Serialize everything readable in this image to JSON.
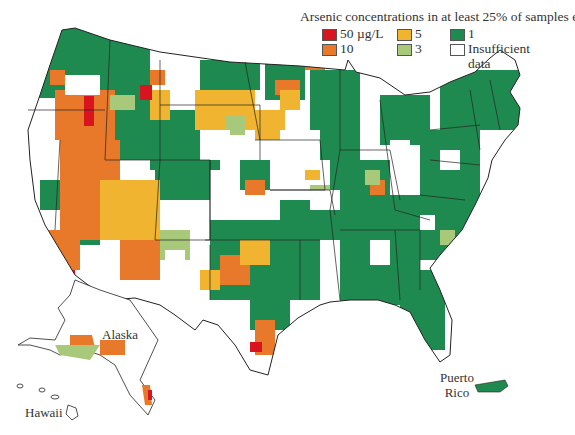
{
  "legend": {
    "title": "Arsenic concentrations in at least 25% of samples exceed:",
    "items": [
      {
        "label": "50 µg/L",
        "color": "#d9141e",
        "col": 0,
        "row": 0
      },
      {
        "label": "10",
        "color": "#e8782a",
        "col": 0,
        "row": 1
      },
      {
        "label": "5",
        "color": "#f0b431",
        "col": 1,
        "row": 0
      },
      {
        "label": "3",
        "color": "#a8c97a",
        "col": 1,
        "row": 1
      },
      {
        "label": "1",
        "color": "#1f8a4f",
        "col": 2,
        "row": 0
      },
      {
        "label": "Insufficient data",
        "color": "#ffffff",
        "col": 2,
        "row": 1
      }
    ]
  },
  "labels": {
    "alaska": "Alaska",
    "hawaii": "Hawaii",
    "puerto_rico_line1": "Puerto",
    "puerto_rico_line2": "Rico"
  },
  "colors": {
    "c50": "#d9141e",
    "c10": "#e8782a",
    "c5": "#f0b431",
    "c3": "#a8c97a",
    "c1": "#1f8a4f",
    "none": "#ffffff",
    "border": "#222222"
  }
}
